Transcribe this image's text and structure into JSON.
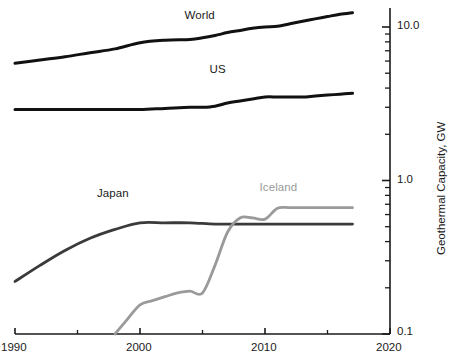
{
  "chart_data": {
    "type": "line",
    "title": "",
    "subtitle": "",
    "xlabel": "",
    "ylabel": "Geothermal Capacity, GW",
    "xlim": [
      1990,
      2020
    ],
    "ylim": [
      0.1,
      13.0
    ],
    "yscale": "log",
    "xscale": "linear",
    "grid": false,
    "legend": "inline-labels",
    "x_ticks": [
      1990,
      2000,
      2010,
      2020
    ],
    "x_tick_labels": [
      "1990",
      "2000",
      "2010",
      "2020"
    ],
    "x_minor_ticks": [
      1995,
      2005,
      2015
    ],
    "y_ticks": [
      0.1,
      1.0,
      10.0
    ],
    "y_tick_labels": [
      "0.1",
      "1.0",
      "10.0"
    ],
    "axis_position": {
      "y_axis": "right",
      "x_axis": "bottom"
    },
    "series": [
      {
        "name": "World",
        "color": "#111111",
        "label_x": 2005.0,
        "label_y": 11.6,
        "x": [
          1990,
          1992,
          1994,
          1996,
          1998,
          2000,
          2002,
          2004,
          2005,
          2006,
          2007,
          2008,
          2009,
          2010,
          2011,
          2012,
          2013,
          2014,
          2015,
          2016,
          2017
        ],
        "values": [
          5.8,
          6.1,
          6.4,
          6.8,
          7.2,
          7.9,
          8.2,
          8.3,
          8.5,
          8.8,
          9.2,
          9.5,
          9.8,
          10.0,
          10.1,
          10.5,
          10.9,
          11.3,
          11.7,
          12.1,
          12.4
        ]
      },
      {
        "name": "US",
        "color": "#111111",
        "label_x": 2007.0,
        "label_y": 5.2,
        "x": [
          1990,
          1992,
          1994,
          1996,
          1998,
          2000,
          2002,
          2004,
          2005,
          2006,
          2007,
          2008,
          2009,
          2010,
          2011,
          2012,
          2013,
          2014,
          2015,
          2016,
          2017
        ],
        "values": [
          2.9,
          2.9,
          2.9,
          2.9,
          2.9,
          2.9,
          2.95,
          3.0,
          3.0,
          3.05,
          3.2,
          3.3,
          3.4,
          3.5,
          3.5,
          3.5,
          3.5,
          3.55,
          3.6,
          3.65,
          3.7
        ]
      },
      {
        "name": "Japan",
        "color": "#3a3a3a",
        "label_x": 1998.0,
        "label_y": 0.8,
        "x": [
          1990,
          1992,
          1994,
          1996,
          1998,
          2000,
          2002,
          2004,
          2006,
          2008,
          2010,
          2012,
          2014,
          2016,
          2017
        ],
        "values": [
          0.22,
          0.28,
          0.35,
          0.42,
          0.48,
          0.53,
          0.53,
          0.53,
          0.52,
          0.52,
          0.52,
          0.52,
          0.52,
          0.52,
          0.52
        ]
      },
      {
        "name": "Iceland",
        "color": "#9a9a9a",
        "label_x": 2011.0,
        "label_y": 0.88,
        "x": [
          1998,
          1999,
          2000,
          2001,
          2002,
          2003,
          2004,
          2005,
          2006,
          2007,
          2008,
          2009,
          2010,
          2011,
          2012,
          2013,
          2014,
          2015,
          2016,
          2017
        ],
        "values": [
          0.1,
          0.125,
          0.155,
          0.165,
          0.175,
          0.185,
          0.19,
          0.185,
          0.28,
          0.46,
          0.57,
          0.57,
          0.56,
          0.66,
          0.665,
          0.665,
          0.665,
          0.665,
          0.665,
          0.665
        ]
      }
    ]
  },
  "axis": {
    "y_title": "Geothermal Capacity, GW",
    "y_tick_10": "10.0",
    "y_tick_1": "1.0",
    "y_tick_01": "0.1",
    "x_tick_1990": "1990",
    "x_tick_2000": "2000",
    "x_tick_2010": "2010",
    "x_tick_2020": "2020"
  },
  "series_labels": {
    "world": "World",
    "us": "US",
    "japan": "Japan",
    "iceland": "Iceland"
  },
  "colors": {
    "world": "#111111",
    "us": "#111111",
    "japan": "#3a3a3a",
    "iceland": "#9a9a9a",
    "axis": "#1a1a1a",
    "background": "#ffffff"
  }
}
